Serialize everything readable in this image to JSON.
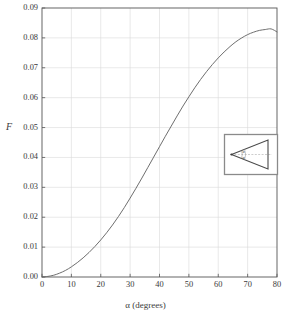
{
  "chart_data": {
    "type": "line",
    "title": "",
    "subtitle": "",
    "xlabel": "α (degrees)",
    "ylabel": "F",
    "xlim": [
      0,
      80
    ],
    "ylim": [
      0,
      0.09
    ],
    "xticks": [
      "0",
      "10",
      "20",
      "30",
      "40",
      "50",
      "60",
      "70",
      "80"
    ],
    "xtick_values": [
      0,
      10,
      20,
      30,
      40,
      50,
      60,
      70,
      80
    ],
    "yticks": [
      "0.00",
      "0.01",
      "0.02",
      "0.03",
      "0.04",
      "0.05",
      "0.06",
      "0.07",
      "0.08",
      "0.09"
    ],
    "ytick_values": [
      0.0,
      0.01,
      0.02,
      0.03,
      0.04,
      0.05,
      0.06,
      0.07,
      0.08,
      0.09
    ],
    "grid": true,
    "grid_color": "#d8d8d8",
    "legend": null,
    "line_color": "#666666",
    "line_width": 0.9,
    "x": [
      0,
      2,
      4,
      6,
      8,
      10,
      12,
      14,
      16,
      18,
      20,
      22,
      24,
      26,
      28,
      30,
      32,
      34,
      36,
      38,
      40,
      42,
      44,
      46,
      48,
      50,
      52,
      54,
      56,
      58,
      60,
      62,
      64,
      66,
      68,
      70,
      72,
      74,
      76,
      78,
      80
    ],
    "y": [
      0.0,
      0.0002,
      0.0006,
      0.0013,
      0.0022,
      0.0034,
      0.0048,
      0.0064,
      0.0082,
      0.0102,
      0.0124,
      0.0148,
      0.0174,
      0.0202,
      0.0232,
      0.0264,
      0.0297,
      0.0331,
      0.0366,
      0.0401,
      0.0436,
      0.0471,
      0.0505,
      0.0539,
      0.0572,
      0.0603,
      0.0633,
      0.0661,
      0.0687,
      0.0711,
      0.0733,
      0.0753,
      0.0771,
      0.0787,
      0.08,
      0.0811,
      0.0819,
      0.0825,
      0.0828,
      0.083,
      0.082
    ]
  },
  "axes": {
    "y_title": "F",
    "x_title": "α (degrees)"
  },
  "inset": {
    "name": "wedge-diagram",
    "angle_label_upper": "α",
    "angle_label_lower": "α",
    "description": "wedge triangle with apex at left and half-angle alpha above and below the dashed centerline"
  }
}
